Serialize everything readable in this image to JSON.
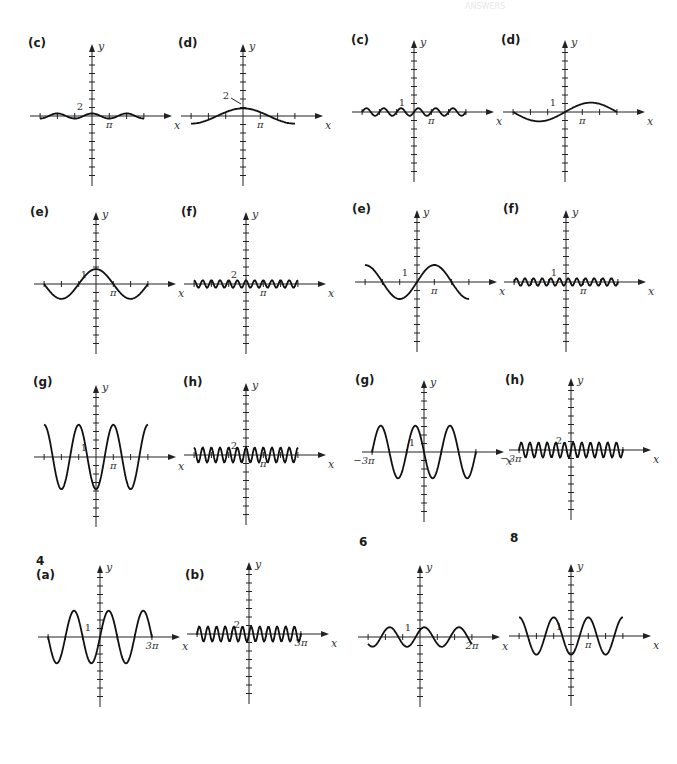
{
  "header": {
    "faint_text": "ANSWERS"
  },
  "section_labels": [
    {
      "id": "4",
      "label": "4",
      "x": 36,
      "y": 554
    },
    {
      "id": "6",
      "label": "6",
      "x": 359,
      "y": 535
    },
    {
      "id": "8",
      "label": "8",
      "x": 510,
      "y": 531
    }
  ],
  "chart_data": [
    {
      "type": "line",
      "panel": "(c)",
      "group": "left",
      "ox": 92,
      "oy": 116,
      "label_x": 28,
      "label_y": 36,
      "title": "(c)",
      "xlabel": "x",
      "ylabel": "y",
      "unit_px": 17,
      "function": "0.25*cos(x)",
      "amplitude": 0.3,
      "period_pi": 2,
      "phase": 0,
      "offset": 0,
      "x_range_pi": [
        -3,
        3
      ],
      "tick_labels": [
        {
          "text": "2",
          "axis": "y",
          "value": 2
        },
        {
          "text": "π",
          "axis": "x",
          "value": 1
        }
      ],
      "y_tick_count": 8,
      "x_tick_count": 3,
      "y_label_value": 2
    },
    {
      "type": "line",
      "panel": "(d)",
      "group": "left",
      "ox": 243,
      "oy": 116,
      "label_x": 178,
      "label_y": 36,
      "title": "(d)",
      "xlabel": "x",
      "ylabel": "y",
      "unit_px": 17,
      "function": "cos(x/3)",
      "amplitude": 0.9,
      "period_pi": 6,
      "phase": 0,
      "offset": 0,
      "x_range_pi": [
        -3,
        3
      ],
      "tick_labels": [
        {
          "text": "2",
          "axis": "y",
          "value": 2
        },
        {
          "text": "π",
          "axis": "x",
          "value": 1
        }
      ],
      "y_tick_count": 8,
      "x_tick_count": 3,
      "y_label_value": 2,
      "leader_line": true
    },
    {
      "type": "line",
      "panel": "(c)",
      "group": "right",
      "ox": 414,
      "oy": 112,
      "label_x": 351,
      "label_y": 33,
      "title": "(c)",
      "xlabel": "x",
      "ylabel": "y",
      "unit_px": 17,
      "function": "0.5*sin(2x)",
      "amplitude": 0.45,
      "period_pi": 1,
      "phase": 0,
      "offset": 0,
      "x_range_pi": [
        -3,
        3
      ],
      "tick_labels": [
        {
          "text": "1",
          "axis": "y",
          "value": 1
        },
        {
          "text": "π",
          "axis": "x",
          "value": 1
        }
      ],
      "y_tick_count": 10,
      "x_tick_count": 3,
      "y_label_value": 1
    },
    {
      "type": "line",
      "panel": "(d)",
      "group": "right",
      "ox": 565,
      "oy": 112,
      "label_x": 501,
      "label_y": 33,
      "title": "(d)",
      "xlabel": "x",
      "ylabel": "y",
      "unit_px": 17,
      "function": "sin(x/3)",
      "amplitude": 1.1,
      "period_pi": 6,
      "phase": 0,
      "offset": 0,
      "x_range_pi": [
        -3,
        3
      ],
      "tick_labels": [
        {
          "text": "1",
          "axis": "y",
          "value": 1
        },
        {
          "text": "π",
          "axis": "x",
          "value": 1
        }
      ],
      "y_tick_count": 10,
      "x_tick_count": 3,
      "y_label_value": 1
    },
    {
      "type": "line",
      "panel": "(e)",
      "group": "left",
      "ox": 96,
      "oy": 284,
      "label_x": 30,
      "label_y": 205,
      "title": "(e)",
      "xlabel": "x",
      "ylabel": "y",
      "unit_px": 17,
      "function": "2*cos(x/2)",
      "amplitude": 1.75,
      "period_pi": 4,
      "phase": 0,
      "offset": 0,
      "x_range_pi": [
        -3,
        3
      ],
      "tick_labels": [
        {
          "text": "1",
          "axis": "y",
          "value": 1
        },
        {
          "text": "π",
          "axis": "x",
          "value": 1
        }
      ],
      "y_tick_count": 10,
      "x_tick_count": 3,
      "y_label_value": 1
    },
    {
      "type": "line",
      "panel": "(f)",
      "group": "left",
      "ox": 246,
      "oy": 284,
      "label_x": 181,
      "label_y": 205,
      "title": "(f)",
      "xlabel": "x",
      "ylabel": "y",
      "unit_px": 17,
      "function": "0.25*cos(4x)",
      "amplitude": 0.45,
      "period_pi": 0.5,
      "phase": 0,
      "offset": 0,
      "x_range_pi": [
        -3,
        3
      ],
      "tick_labels": [
        {
          "text": "2",
          "axis": "y",
          "value": 2
        },
        {
          "text": "π",
          "axis": "x",
          "value": 1
        }
      ],
      "y_tick_count": 8,
      "x_tick_count": 3,
      "y_label_value": 2
    },
    {
      "type": "line",
      "panel": "(e)",
      "group": "right",
      "ox": 417,
      "oy": 282,
      "label_x": 352,
      "label_y": 202,
      "title": "(e)",
      "xlabel": "x",
      "ylabel": "y",
      "unit_px": 17,
      "function": "2*sin(x/2)",
      "amplitude": 2.0,
      "period_pi": 4,
      "phase": 0,
      "offset": 0,
      "x_range_pi": [
        -3,
        3
      ],
      "tick_labels": [
        {
          "text": "1",
          "axis": "y",
          "value": 1
        },
        {
          "text": "π",
          "axis": "x",
          "value": 1
        }
      ],
      "y_tick_count": 10,
      "x_tick_count": 3,
      "y_label_value": 1,
      "x_clip_pi": [
        -3,
        3
      ]
    },
    {
      "type": "line",
      "panel": "(f)",
      "group": "right",
      "ox": 566,
      "oy": 282,
      "label_x": 503,
      "label_y": 202,
      "title": "(f)",
      "xlabel": "x",
      "ylabel": "y",
      "unit_px": 17,
      "function": "0.5*sin(4x)",
      "amplitude": 0.45,
      "period_pi": 0.5,
      "phase": 0,
      "offset": 0,
      "x_range_pi": [
        -3,
        3
      ],
      "tick_labels": [
        {
          "text": "1",
          "axis": "y",
          "value": 1
        },
        {
          "text": "π",
          "axis": "x",
          "value": 1
        }
      ],
      "y_tick_count": 10,
      "x_tick_count": 3,
      "y_label_value": 1
    },
    {
      "type": "line",
      "panel": "(g)",
      "group": "left",
      "ox": 96,
      "oy": 457,
      "label_x": 33,
      "label_y": 375,
      "title": "(g)",
      "xlabel": "x",
      "ylabel": "y",
      "unit_px": 17,
      "function": "-3*cos(x)",
      "amplitude": 3.8,
      "period_pi": 2,
      "phase_pi": 1,
      "offset": 0,
      "x_range_pi": [
        -3,
        3
      ],
      "tick_labels": [
        {
          "text": "1",
          "axis": "y",
          "value": 1
        },
        {
          "text": "π",
          "axis": "x",
          "value": 1
        }
      ],
      "y_tick_count": 10,
      "x_tick_count": 3,
      "y_label_value": 1
    },
    {
      "type": "line",
      "panel": "(h)",
      "group": "left",
      "ox": 246,
      "oy": 455,
      "label_x": 183,
      "label_y": 375,
      "title": "(h)",
      "xlabel": "x",
      "ylabel": "y",
      "unit_px": 17,
      "function": "0.5*cos(4x)",
      "amplitude": 0.9,
      "period_pi": 0.5,
      "phase": 0,
      "offset": 0,
      "x_range_pi": [
        -3,
        3
      ],
      "tick_labels": [
        {
          "text": "2",
          "axis": "y",
          "value": 2
        },
        {
          "text": "π",
          "axis": "x",
          "value": 1
        }
      ],
      "y_tick_count": 8,
      "x_tick_count": 3,
      "y_label_value": 2
    },
    {
      "type": "line",
      "panel": "(g)",
      "group": "right",
      "ox": 424,
      "oy": 452,
      "label_x": 355,
      "label_y": 373,
      "title": "(g)",
      "xlabel": "x",
      "ylabel": "y",
      "unit_px": 17,
      "function": "-3*sin(x)",
      "amplitude": 3.1,
      "period_pi": 2,
      "phase_pi": 1,
      "offset": 0,
      "x_range_pi": [
        -3,
        1
      ],
      "tick_labels": [
        {
          "text": "1",
          "axis": "y",
          "value": 1
        },
        {
          "text": "−3π",
          "axis": "x",
          "value": -3
        }
      ],
      "y_tick_count": 10,
      "x_tick_count": 0,
      "y_label_value": 1,
      "neg_label": true,
      "x_span_px": [
        -109,
        56
      ]
    },
    {
      "type": "line",
      "panel": "(h)",
      "group": "right",
      "ox": 571,
      "oy": 450,
      "label_x": 505,
      "label_y": 373,
      "title": "(h)",
      "xlabel": "x",
      "ylabel": "y",
      "unit_px": 17,
      "function": "sin(4x)",
      "amplitude": 0.9,
      "period_pi": 0.5,
      "phase_pi": 0.25,
      "offset": 0,
      "x_range_pi": [
        -3,
        3
      ],
      "tick_labels": [
        {
          "text": "2",
          "axis": "y",
          "value": 2
        },
        {
          "text": "−3π",
          "axis": "x",
          "value": -3
        }
      ],
      "y_tick_count": 8,
      "x_tick_count": 0,
      "y_label_value": 2,
      "neg_label": true
    },
    {
      "type": "line",
      "panel": "(a)",
      "group": "left",
      "ox": 100,
      "oy": 637,
      "label_x": 36,
      "label_y": 568,
      "title": "(a)",
      "xlabel": "x",
      "ylabel": "y",
      "unit_px": 17,
      "function": "sin(x)",
      "amplitude": 3.1,
      "period_pi": 2,
      "phase": 0,
      "offset": 0,
      "x_range_pi": [
        -3,
        3
      ],
      "tick_labels": [
        {
          "text": "1",
          "axis": "y",
          "value": 1
        },
        {
          "text": "3π",
          "axis": "x",
          "value": 3
        }
      ],
      "y_tick_count": 10,
      "x_tick_count": 0,
      "y_label_value": 1
    },
    {
      "type": "line",
      "panel": "(b)",
      "group": "left",
      "ox": 249,
      "oy": 634,
      "label_x": 185,
      "label_y": 568,
      "title": "(b)",
      "xlabel": "x",
      "ylabel": "y",
      "unit_px": 17,
      "function": "0.5*sin(4x)",
      "amplitude": 0.9,
      "period_pi": 0.5,
      "phase": 0,
      "offset": 0,
      "x_range_pi": [
        -3,
        3
      ],
      "tick_labels": [
        {
          "text": "2",
          "axis": "y",
          "value": 2
        },
        {
          "text": "3π",
          "axis": "x",
          "value": 3
        }
      ],
      "y_tick_count": 8,
      "x_tick_count": 0,
      "y_label_value": 2
    },
    {
      "type": "line",
      "panel": "6",
      "group": "right",
      "ox": 420,
      "oy": 637,
      "label_x": 0,
      "label_y": 0,
      "title": "",
      "xlabel": "x",
      "ylabel": "y",
      "unit_px": 17,
      "function": "cos(x-π/4)",
      "amplitude": 1.15,
      "period_pi": 2,
      "phase_pi": 0.25,
      "offset": 0,
      "x_range_pi": [
        -3,
        3
      ],
      "tick_labels": [
        {
          "text": "1",
          "axis": "y",
          "value": 1
        },
        {
          "text": "2π",
          "axis": "x",
          "value": 2
        }
      ],
      "y_tick_count": 10,
      "x_tick_count": 3,
      "y_label_value": 1
    },
    {
      "type": "line",
      "panel": "8",
      "group": "right",
      "ox": 571,
      "oy": 636,
      "label_x": 0,
      "label_y": 0,
      "title": "",
      "xlabel": "x",
      "ylabel": "y",
      "unit_px": 17,
      "function": "-2*cos(x)",
      "amplitude": 2.2,
      "period_pi": 2,
      "phase_pi": 1,
      "offset": 0,
      "x_range_pi": [
        -3,
        3
      ],
      "tick_labels": [
        {
          "text": "1",
          "axis": "y",
          "value": 1
        },
        {
          "text": "π",
          "axis": "x",
          "value": 1
        }
      ],
      "y_tick_count": 10,
      "x_tick_count": 3,
      "y_label_value": 1
    }
  ]
}
